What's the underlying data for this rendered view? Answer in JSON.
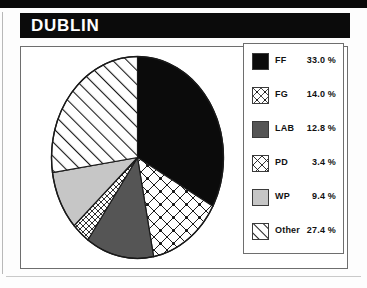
{
  "figure": {
    "title": "DUBLIN"
  },
  "chart_data": {
    "type": "pie",
    "title": "DUBLIN",
    "xlabel": "",
    "ylabel": "",
    "legend_position": "right",
    "grid": false,
    "start_angle_deg": 0,
    "direction": "clockwise",
    "categories": [
      "FF",
      "FG",
      "LAB",
      "PD",
      "WP",
      "Other"
    ],
    "values": [
      33.0,
      14.0,
      12.8,
      3.4,
      9.4,
      27.4
    ],
    "value_labels": [
      "33.0 %",
      "14.0 %",
      "12.8 %",
      "3.4 %",
      "9.4 %",
      "27.4 %"
    ],
    "slices": [
      {
        "label": "FF",
        "value": 33.0,
        "value_label": "33.0 %",
        "fill": "solid-black",
        "color": "#0b0b0b"
      },
      {
        "label": "FG",
        "value": 14.0,
        "value_label": "14.0 %",
        "fill": "crosshatch-dots",
        "color": "#ffffff"
      },
      {
        "label": "LAB",
        "value": 12.8,
        "value_label": "12.8 %",
        "fill": "solid-dark-gray",
        "color": "#555555"
      },
      {
        "label": "PD",
        "value": 3.4,
        "value_label": "3.4 %",
        "fill": "fine-crosshatch",
        "color": "#ffffff"
      },
      {
        "label": "WP",
        "value": 9.4,
        "value_label": "9.4 %",
        "fill": "solid-light-gray",
        "color": "#c6c6c6"
      },
      {
        "label": "Other",
        "value": 27.4,
        "value_label": "27.4 %",
        "fill": "diagonal-lines",
        "color": "#ffffff"
      }
    ]
  },
  "colors": {
    "title_bar_bg": "#0b0b0b",
    "title_text": "#ffffff",
    "border": "#6e6e6e",
    "ink": "#111111",
    "page_bg": "#ffffff"
  }
}
